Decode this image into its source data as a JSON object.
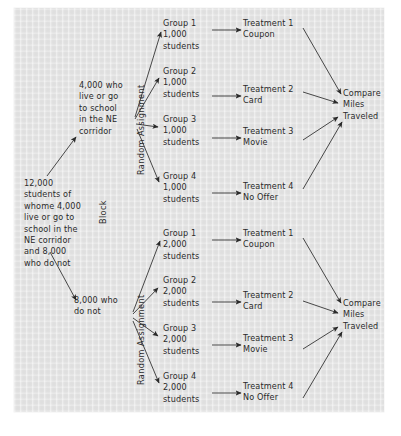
{
  "diagram": {
    "background_color": "#e2e2e2",
    "ink_color": "#2a2a2a",
    "source": {
      "label": "12,000\nstudents of\nwhome 4,000\nlive or go to\nschool in the\nNE corridor\nand 8,000\nwho do not"
    },
    "block_label": "Block",
    "random_assignment_label": "Random Assignment",
    "blocks": [
      {
        "id": "ne-corridor",
        "label": "4,000 who\nlive or go\nto school\nin the NE\ncorridor",
        "groups": [
          {
            "name": "Group 1",
            "size": "1,000",
            "unit": "students"
          },
          {
            "name": "Group 2",
            "size": "1,000",
            "unit": "students"
          },
          {
            "name": "Group 3",
            "size": "1,000",
            "unit": "students"
          },
          {
            "name": "Group 4",
            "size": "1,000",
            "unit": "students"
          }
        ],
        "treatments": [
          {
            "name": "Treatment 1",
            "detail": "Coupon"
          },
          {
            "name": "Treatment 2",
            "detail": "Card"
          },
          {
            "name": "Treatment 3",
            "detail": "Movie"
          },
          {
            "name": "Treatment 4",
            "detail": "No Offer"
          }
        ],
        "outcome": "Compare\nMiles\nTraveled"
      },
      {
        "id": "not-ne-corridor",
        "label": "8,000 who\ndo not",
        "groups": [
          {
            "name": "Group 1",
            "size": "2,000",
            "unit": "students"
          },
          {
            "name": "Group 2",
            "size": "2,000",
            "unit": "students"
          },
          {
            "name": "Group 3",
            "size": "2,000",
            "unit": "students"
          },
          {
            "name": "Group 4",
            "size": "2,000",
            "unit": "students"
          }
        ],
        "treatments": [
          {
            "name": "Treatment 1",
            "detail": "Coupon"
          },
          {
            "name": "Treatment 2",
            "detail": "Card"
          },
          {
            "name": "Treatment 3",
            "detail": "Movie"
          },
          {
            "name": "Treatment 4",
            "detail": "No Offer"
          }
        ],
        "outcome": "Compare\nMiles\nTraveled"
      }
    ],
    "group_text": {
      "a1": "Group 1\n1,000\nstudents",
      "a2": "Group 2\n1,000\nstudents",
      "a3": "Group 3\n1,000\nstudents",
      "a4": "Group 4\n1,000\nstudents",
      "b1": "Group 1\n2,000\nstudents",
      "b2": "Group 2\n2,000\nstudents",
      "b3": "Group 3\n2,000\nstudents",
      "b4": "Group 4\n2,000\nstudents"
    },
    "treatment_text": {
      "t1": "Treatment 1\nCoupon",
      "t2": "Treatment 2\nCard",
      "t3": "Treatment 3\nMovie",
      "t4": "Treatment 4\nNo Offer"
    },
    "outcome_text": "Compare\nMiles\nTraveled"
  }
}
